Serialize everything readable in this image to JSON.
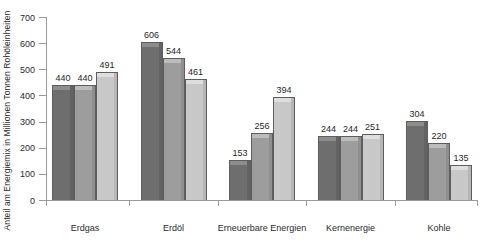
{
  "chart_data": {
    "type": "bar",
    "title": "",
    "xlabel": "",
    "ylabel": "Anteil am Energiemix in Millionen Tonnen Rohöleinheiten",
    "ylim": [
      0,
      700
    ],
    "ytick_labels": [
      "700",
      "600",
      "500",
      "400",
      "300",
      "200",
      "100",
      "0"
    ],
    "yticks": [
      700,
      600,
      500,
      400,
      300,
      200,
      100,
      0
    ],
    "grid": false,
    "legend": "none",
    "categories": [
      "Erdgas",
      "Erdöl",
      "Erneuerbare Energien",
      "Kernenergie",
      "Kohle"
    ],
    "series": [
      {
        "name": "series-1",
        "color": "#6e6e6e",
        "values": [
          440,
          606,
          153,
          244,
          304
        ]
      },
      {
        "name": "series-2",
        "color": "#9d9d9d",
        "values": [
          440,
          544,
          256,
          244,
          220
        ]
      },
      {
        "name": "series-3",
        "color": "#c8c8c8",
        "values": [
          491,
          461,
          394,
          251,
          135
        ]
      }
    ],
    "value_labels": [
      [
        "440",
        "440",
        "491"
      ],
      [
        "606",
        "544",
        "461"
      ],
      [
        "153",
        "256",
        "394"
      ],
      [
        "244",
        "244",
        "251"
      ],
      [
        "304",
        "220",
        "135"
      ]
    ]
  },
  "style": {
    "axis_color": "#9a9a9a",
    "text_color": "#2b2b2b",
    "background": "#ffffff"
  }
}
